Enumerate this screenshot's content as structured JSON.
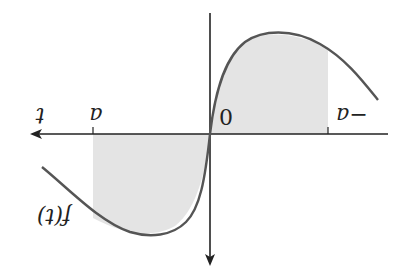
{
  "figure": {
    "orientation": "rotated 180 degrees",
    "labels": {
      "t_axis": "t",
      "f_axis": "f(t)",
      "origin": "0",
      "tick_a": "a",
      "tick_neg_a": "−a"
    },
    "colors": {
      "curve": "#555555",
      "shade": "#e4e4e4",
      "axis": "#222222",
      "background": "#ffffff"
    }
  }
}
